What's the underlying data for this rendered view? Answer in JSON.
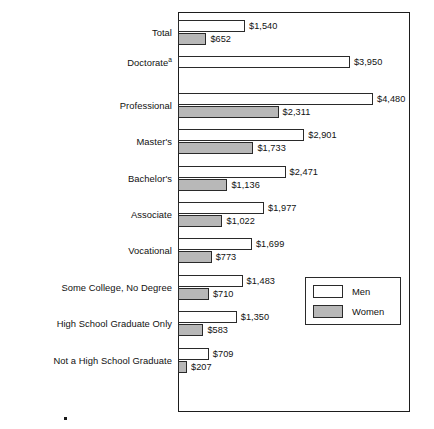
{
  "chart_data": {
    "type": "bar",
    "orientation": "horizontal",
    "title": "",
    "xlabel": "",
    "ylabel": "",
    "grid": false,
    "xlim": [
      0,
      4480
    ],
    "axis_visible": false,
    "legend": {
      "position": "inside-lower-right",
      "entries": [
        {
          "name": "Men",
          "color": "#ffffff"
        },
        {
          "name": "Women",
          "color": "#b8b8b8"
        }
      ]
    },
    "categories": [
      "Total",
      "Doctorate",
      "Professional",
      "Master's",
      "Bachelor's",
      "Associate",
      "Vocational",
      "Some College, No Degree",
      "High School Graduate Only",
      "Not a High School Graduate"
    ],
    "category_footnotes": [
      "",
      "a",
      "",
      "",
      "",
      "",
      "",
      "",
      "",
      ""
    ],
    "series": [
      {
        "name": "Men",
        "color": "#ffffff",
        "values": [
          1540,
          3950,
          4480,
          2901,
          2471,
          1977,
          1699,
          1483,
          1350,
          709
        ],
        "labels": [
          "$1,540",
          "$3,950",
          "$4,480",
          "$2,901",
          "$2,471",
          "$1,977",
          "$1,699",
          "$1,483",
          "$1,350",
          "$709"
        ]
      },
      {
        "name": "Women",
        "color": "#b8b8b8",
        "values": [
          652,
          null,
          2311,
          1733,
          1136,
          1022,
          773,
          710,
          583,
          207
        ],
        "labels": [
          "$652",
          "",
          "$2,311",
          "$1,733",
          "$1,136",
          "$1,022",
          "$773",
          "$710",
          "$583",
          "$207"
        ]
      }
    ]
  },
  "legend": {
    "men_label": "Men",
    "women_label": "Women"
  },
  "colors": {
    "men_fill": "#ffffff",
    "women_fill": "#b8b8b8",
    "outline": "#2a2a2a",
    "frame": "#1d1d1d",
    "text": "#111111"
  },
  "categories": [
    {
      "label": "Total",
      "footnote": ""
    },
    {
      "label": "Doctorate",
      "footnote": "a"
    },
    {
      "label": "Professional",
      "footnote": ""
    },
    {
      "label": "Master's",
      "footnote": ""
    },
    {
      "label": "Bachelor's",
      "footnote": ""
    },
    {
      "label": "Associate",
      "footnote": ""
    },
    {
      "label": "Vocational",
      "footnote": ""
    },
    {
      "label": "Some College, No Degree",
      "footnote": ""
    },
    {
      "label": "High School Graduate Only",
      "footnote": ""
    },
    {
      "label": "Not a High School Graduate",
      "footnote": ""
    }
  ]
}
